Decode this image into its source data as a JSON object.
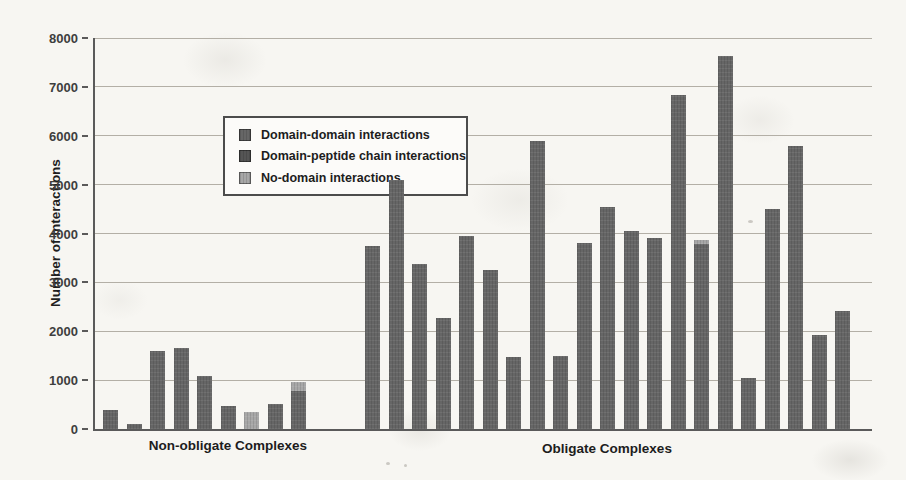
{
  "figure": {
    "background_color": "#f7f6f2",
    "axis_color": "#5a5a5a",
    "gridline_color": "#b3afa6"
  },
  "chart_data": {
    "type": "bar",
    "title": "",
    "xlabel": "",
    "ylabel": "Number of Interactions",
    "ylim": [
      0,
      8000
    ],
    "ytick_step": 1000,
    "yticks": [
      "0",
      "1000",
      "2000",
      "3000",
      "4000",
      "5000",
      "6000",
      "7000",
      "8000"
    ],
    "grid": "horizontal",
    "legend_position": "upper-left-inside",
    "legend": [
      {
        "key": "dd",
        "label": "Domain-domain interactions",
        "color": "#666666"
      },
      {
        "key": "dp",
        "label": "Domain-peptide chain interactions",
        "color": "#555555"
      },
      {
        "key": "nd",
        "label": "No-domain interactions",
        "color": "#a7a7a7"
      }
    ],
    "groups": [
      {
        "label": "Non-obligate Complexes",
        "bars": [
          {
            "segments": [
              {
                "s": "dd",
                "v": 390
              }
            ]
          },
          {
            "segments": [
              {
                "s": "dd",
                "v": 100
              }
            ]
          },
          {
            "segments": [
              {
                "s": "dd",
                "v": 1600
              }
            ]
          },
          {
            "segments": [
              {
                "s": "dd",
                "v": 1660
              }
            ]
          },
          {
            "segments": [
              {
                "s": "dd",
                "v": 1090
              }
            ]
          },
          {
            "segments": [
              {
                "s": "dd",
                "v": 470
              }
            ]
          },
          {
            "segments": [
              {
                "s": "nd",
                "v": 340
              }
            ]
          },
          {
            "segments": [
              {
                "s": "dd",
                "v": 510
              }
            ]
          },
          {
            "segments": [
              {
                "s": "dd",
                "v": 780
              },
              {
                "s": "nd",
                "v": 180
              }
            ]
          }
        ]
      },
      {
        "label": "Obligate Complexes",
        "bars": [
          {
            "segments": [
              {
                "s": "dd",
                "v": 3750
              }
            ]
          },
          {
            "segments": [
              {
                "s": "dd",
                "v": 5100
              }
            ]
          },
          {
            "segments": [
              {
                "s": "dd",
                "v": 3370
              }
            ]
          },
          {
            "segments": [
              {
                "s": "dd",
                "v": 2280
              }
            ]
          },
          {
            "segments": [
              {
                "s": "dd",
                "v": 3960
              }
            ]
          },
          {
            "segments": [
              {
                "s": "dd",
                "v": 3250
              }
            ]
          },
          {
            "segments": [
              {
                "s": "dd",
                "v": 1480
              }
            ]
          },
          {
            "segments": [
              {
                "s": "dd",
                "v": 5900
              }
            ]
          },
          {
            "segments": [
              {
                "s": "dd",
                "v": 1490
              }
            ]
          },
          {
            "segments": [
              {
                "s": "dd",
                "v": 3800
              }
            ]
          },
          {
            "segments": [
              {
                "s": "dd",
                "v": 4550
              }
            ]
          },
          {
            "segments": [
              {
                "s": "dd",
                "v": 4050
              }
            ]
          },
          {
            "segments": [
              {
                "s": "dd",
                "v": 3900
              }
            ]
          },
          {
            "segments": [
              {
                "s": "dd",
                "v": 6830
              }
            ]
          },
          {
            "segments": [
              {
                "s": "dd",
                "v": 3790
              },
              {
                "s": "nd",
                "v": 70
              }
            ]
          },
          {
            "segments": [
              {
                "s": "dd",
                "v": 7630
              }
            ]
          },
          {
            "segments": [
              {
                "s": "dd",
                "v": 1050
              }
            ]
          },
          {
            "segments": [
              {
                "s": "dd",
                "v": 4500
              }
            ]
          },
          {
            "segments": [
              {
                "s": "dd",
                "v": 5790
              }
            ]
          },
          {
            "segments": [
              {
                "s": "dd",
                "v": 1920
              }
            ]
          },
          {
            "segments": [
              {
                "s": "dd",
                "v": 2420
              }
            ]
          }
        ]
      }
    ]
  }
}
